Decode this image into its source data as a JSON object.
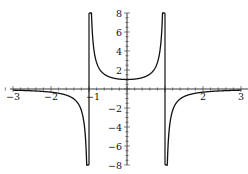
{
  "chart_data": {
    "type": "line",
    "title": "",
    "function": "1/(1-x^2)",
    "xlabel": "",
    "ylabel": "",
    "xlim": [
      -3.2,
      3.1
    ],
    "ylim": [
      -8,
      8
    ],
    "x_ticks": [
      -3,
      -2,
      -1,
      1,
      2,
      3
    ],
    "x_tick_labels": [
      "-3",
      "-2",
      "-1",
      "",
      "2",
      "3"
    ],
    "y_ticks": [
      -8,
      -6,
      -4,
      -2,
      2,
      4,
      6,
      8
    ],
    "y_tick_labels": [
      "-8",
      "-6",
      "-4",
      "-2",
      "2",
      "4",
      "6",
      "8"
    ],
    "vertical_asymptotes": [
      -1,
      1
    ],
    "grid": false,
    "legend": null,
    "series": [
      {
        "name": "left branch",
        "domain": [
          -3,
          -1
        ],
        "sample": [
          [
            -3,
            -0.125
          ],
          [
            -2,
            -0.333
          ],
          [
            -1.5,
            -0.8
          ],
          [
            -1.1,
            -4.76
          ],
          [
            -1.06,
            -8
          ]
        ]
      },
      {
        "name": "middle branch",
        "domain": [
          -1,
          1
        ],
        "sample": [
          [
            -0.94,
            8
          ],
          [
            -0.9,
            5.26
          ],
          [
            -0.5,
            1.333
          ],
          [
            0,
            1
          ],
          [
            0.5,
            1.333
          ],
          [
            0.9,
            5.26
          ],
          [
            0.94,
            8
          ]
        ]
      },
      {
        "name": "right branch",
        "domain": [
          1,
          3
        ],
        "sample": [
          [
            1.06,
            -8
          ],
          [
            1.1,
            -4.76
          ],
          [
            1.5,
            -0.8
          ],
          [
            2,
            -0.333
          ],
          [
            3,
            -0.125
          ]
        ]
      }
    ]
  }
}
